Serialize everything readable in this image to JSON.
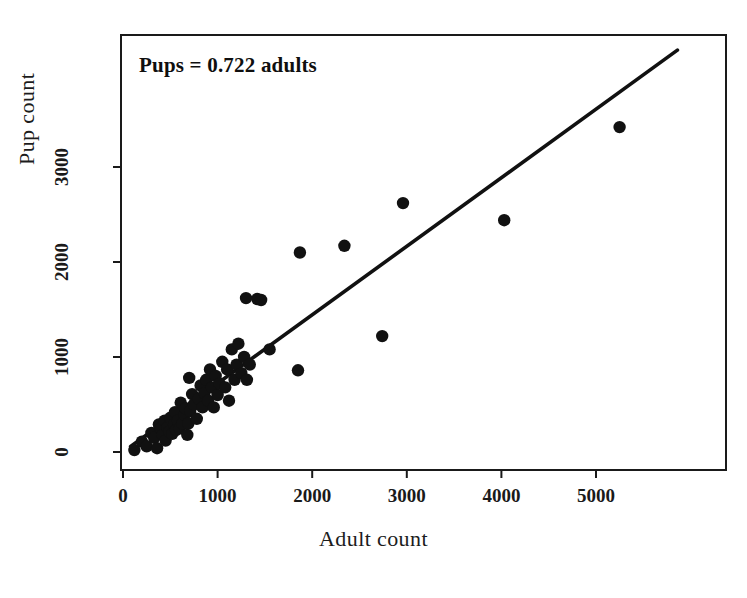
{
  "chart_data": {
    "type": "scatter",
    "title": "",
    "annotation": "Pups = 0.722 adults",
    "xlabel": "Adult count",
    "ylabel": "Pup count",
    "xlim": [
      -130,
      6270
    ],
    "ylim": [
      -185,
      4390
    ],
    "xticks": [
      0,
      1000,
      2000,
      3000,
      4000,
      5000
    ],
    "yticks": [
      0,
      1000,
      2000,
      3000
    ],
    "xtick_labels": [
      "0",
      "1000",
      "2000",
      "3000",
      "4000",
      "5000"
    ],
    "ytick_labels": [
      "0",
      "1000",
      "2000",
      "3000"
    ],
    "grid": false,
    "legend": null,
    "marker_color": "#111111",
    "line_color": "#111111",
    "frame": true,
    "fit_line": {
      "slope": 0.722,
      "intercept": 0,
      "x_start": 80,
      "x_end": 5860
    },
    "points": [
      [
        120,
        20
      ],
      [
        200,
        110
      ],
      [
        250,
        60
      ],
      [
        300,
        200
      ],
      [
        330,
        150
      ],
      [
        360,
        40
      ],
      [
        380,
        290
      ],
      [
        400,
        250
      ],
      [
        420,
        180
      ],
      [
        440,
        330
      ],
      [
        450,
        120
      ],
      [
        470,
        260
      ],
      [
        490,
        215
      ],
      [
        500,
        360
      ],
      [
        520,
        190
      ],
      [
        540,
        290
      ],
      [
        550,
        420
      ],
      [
        560,
        230
      ],
      [
        580,
        330
      ],
      [
        600,
        250
      ],
      [
        610,
        520
      ],
      [
        630,
        300
      ],
      [
        650,
        390
      ],
      [
        660,
        460
      ],
      [
        680,
        180
      ],
      [
        690,
        300
      ],
      [
        700,
        780
      ],
      [
        710,
        430
      ],
      [
        730,
        610
      ],
      [
        750,
        500
      ],
      [
        780,
        350
      ],
      [
        800,
        560
      ],
      [
        820,
        700
      ],
      [
        840,
        470
      ],
      [
        860,
        620
      ],
      [
        880,
        760
      ],
      [
        900,
        540
      ],
      [
        920,
        870
      ],
      [
        940,
        680
      ],
      [
        960,
        470
      ],
      [
        980,
        800
      ],
      [
        1000,
        600
      ],
      [
        1020,
        720
      ],
      [
        1050,
        950
      ],
      [
        1080,
        680
      ],
      [
        1100,
        870
      ],
      [
        1120,
        540
      ],
      [
        1150,
        1080
      ],
      [
        1180,
        760
      ],
      [
        1200,
        920
      ],
      [
        1220,
        1140
      ],
      [
        1250,
        830
      ],
      [
        1280,
        1000
      ],
      [
        1300,
        1620
      ],
      [
        1310,
        760
      ],
      [
        1340,
        920
      ],
      [
        1420,
        1610
      ],
      [
        1460,
        1600
      ],
      [
        1550,
        1080
      ],
      [
        1850,
        860
      ],
      [
        1870,
        2100
      ],
      [
        2340,
        2170
      ],
      [
        2740,
        1220
      ],
      [
        2960,
        2620
      ],
      [
        4030,
        2440
      ],
      [
        5250,
        3420
      ]
    ]
  }
}
